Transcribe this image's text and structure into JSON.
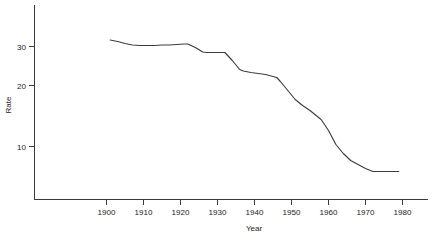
{
  "chart_data": {
    "type": "line",
    "title": "",
    "xlabel": "Year",
    "ylabel": "Rate",
    "xlim": [
      1893,
      1986
    ],
    "ylim": [
      2.0,
      35.5
    ],
    "grid": false,
    "legend": "none",
    "xticks": [
      1900,
      1910,
      1920,
      1930,
      1940,
      1950,
      1960,
      1970,
      1980
    ],
    "xticklabels": [
      "1900",
      "1910",
      "1920",
      "1930",
      "1940",
      "1950",
      "1960",
      "1970",
      "1980"
    ],
    "yticks": [
      10,
      20,
      30
    ],
    "yticklabels": [
      "10",
      "20",
      "30"
    ],
    "series": [
      {
        "name": "Rate",
        "color": "#3c3c3c",
        "x": [
          1901,
          1903,
          1905,
          1907,
          1909,
          1911,
          1913,
          1915,
          1917,
          1919,
          1921,
          1922,
          1924,
          1926,
          1927,
          1929,
          1931,
          1932,
          1934,
          1936,
          1937,
          1939,
          1941,
          1943,
          1945,
          1946,
          1947,
          1949,
          1951,
          1953,
          1955,
          1957,
          1958,
          1960,
          1962,
          1964,
          1966,
          1968,
          1970,
          1972,
          1974,
          1976,
          1979
        ],
        "y": [
          31.3,
          31.0,
          30.6,
          30.3,
          30.2,
          30.2,
          30.2,
          30.3,
          30.3,
          30.4,
          30.5,
          30.5,
          29.8,
          28.9,
          28.8,
          28.8,
          28.8,
          28.8,
          27.2,
          25.4,
          25.1,
          24.8,
          24.6,
          24.4,
          24.0,
          23.8,
          23.0,
          21.2,
          19.4,
          18.2,
          17.2,
          16.0,
          15.4,
          13.2,
          10.4,
          8.6,
          7.2,
          6.4,
          5.6,
          5.0,
          5.0,
          5.0,
          5.0
        ]
      }
    ]
  },
  "axes": {
    "y_axis_label": "Rate",
    "x_axis_label": "Year"
  }
}
